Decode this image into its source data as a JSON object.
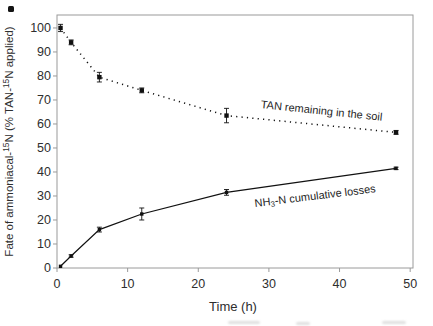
{
  "chart_data": {
    "type": "line",
    "title": "",
    "xlabel": "Time (h)",
    "ylabel": "Fate of ammoniacal-15N (% TAN-15N applied)",
    "ylabel_parts": [
      {
        "t": "Fate of ammoniacal-"
      },
      {
        "t": "15",
        "sup": true
      },
      {
        "t": "N (% TAN-"
      },
      {
        "t": "15",
        "sup": true
      },
      {
        "t": "N applied)"
      }
    ],
    "x": [
      0.5,
      2,
      6,
      12,
      24,
      48
    ],
    "series": [
      {
        "name": "TAN remaining in the soil",
        "line_style": "dotted",
        "marker": "filled-square",
        "values": [
          100,
          94,
          79.5,
          74,
          63.5,
          56.5
        ],
        "error_bars": [
          1.5,
          1,
          2,
          1,
          3,
          0.8
        ]
      },
      {
        "name": "NH₃-N cumulative losses",
        "line_style": "solid",
        "marker": "filled-square",
        "values": [
          0.7,
          5,
          16,
          22.5,
          31.5,
          41.5
        ],
        "error_bars": [
          0,
          0.5,
          1,
          2.5,
          1.2,
          0.5
        ]
      }
    ],
    "annotations": [
      {
        "parts": [
          {
            "t": "TAN remaining in the soil"
          }
        ],
        "x": 37.4,
        "y": 64,
        "angle": 6
      },
      {
        "parts": [
          {
            "t": "NH"
          },
          {
            "t": "3",
            "sub": true
          },
          {
            "t": "-N cumulative losses"
          }
        ],
        "x": 36.6,
        "y": 28.5,
        "angle": -7
      }
    ],
    "xlim": [
      0,
      50.4
    ],
    "ylim": [
      0,
      105.4
    ],
    "xticks": [
      0,
      10,
      20,
      30,
      40,
      50
    ],
    "yticks": [
      0,
      10,
      20,
      30,
      40,
      50,
      60,
      70,
      80,
      90,
      100
    ],
    "grid": false,
    "legend": "inline-annotations",
    "colors": {
      "data": "#111111",
      "frame": "#9a9a9a",
      "text": "#2e2e2e"
    }
  }
}
